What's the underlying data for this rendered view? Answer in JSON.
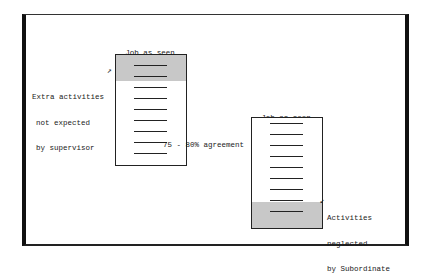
{
  "diagram": {
    "subordinate_view": {
      "title_line1": "Job as seen",
      "title_line2": "by Subordinate",
      "shaded_region": "top",
      "line_count": 9,
      "shaded_line_count": 2
    },
    "supervisor_view": {
      "title_line1": "Job as seen",
      "title_line2": "by Supervisor",
      "shaded_region": "bottom",
      "line_count": 9,
      "shaded_line_count": 2
    },
    "annotations": {
      "extra_line1": "Extra activities",
      "extra_line2": "not expected",
      "extra_line3": "by supervisor",
      "neglected_line1": "Activities",
      "neglected_line2": "neglected",
      "neglected_line3": "by Subordinate",
      "agreement_value": "75",
      "agreement_rest": " - 80% agreement"
    },
    "colors": {
      "ink": "#1a1a1a",
      "shade": "#c8c8c8"
    }
  }
}
